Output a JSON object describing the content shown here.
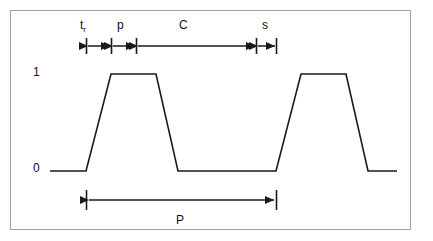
{
  "figure": {
    "kind": "pulse-timing-diagram",
    "background_color": "#ffffff",
    "border_color": "#a0a0a0",
    "line_color": "#1a1a1a"
  },
  "axis": {
    "y_labels": [
      {
        "name": "high",
        "text": "1"
      },
      {
        "name": "low",
        "text": "0"
      }
    ]
  },
  "dimension_labels": {
    "rise_time": {
      "symbol": "t",
      "subscript": "r"
    },
    "plateau": {
      "text": "p"
    },
    "coast": {
      "text": "C"
    },
    "settle": {
      "text": "s"
    },
    "period": {
      "text": "P"
    }
  },
  "chart_data": {
    "type": "line",
    "title": "",
    "xlabel": "",
    "ylabel": "",
    "ylim": [
      0,
      1
    ],
    "yticks": [
      0,
      1
    ],
    "ytick_labels": [
      "0",
      "1"
    ],
    "grid": false,
    "legend": null,
    "series": [
      {
        "name": "pulse-train",
        "x": [
          50,
          86,
          111,
          156,
          178,
          276,
          301,
          346,
          368,
          397
        ],
        "y": [
          0,
          0,
          1,
          1,
          0,
          0,
          1,
          1,
          0,
          0
        ]
      }
    ],
    "annotations": [
      {
        "name": "rise-time-span",
        "label": "t_r",
        "x_start": 86,
        "x_end": 111,
        "row": "top"
      },
      {
        "name": "plateau-span",
        "label": "p",
        "x_start": 111,
        "x_end": 136,
        "row": "top"
      },
      {
        "name": "coast-span",
        "label": "C",
        "x_start": 136,
        "x_end": 256,
        "row": "top"
      },
      {
        "name": "settle-span",
        "label": "s",
        "x_start": 256,
        "x_end": 276,
        "row": "top"
      },
      {
        "name": "period-span",
        "label": "P",
        "x_start": 86,
        "x_end": 276,
        "row": "bottom"
      }
    ]
  }
}
